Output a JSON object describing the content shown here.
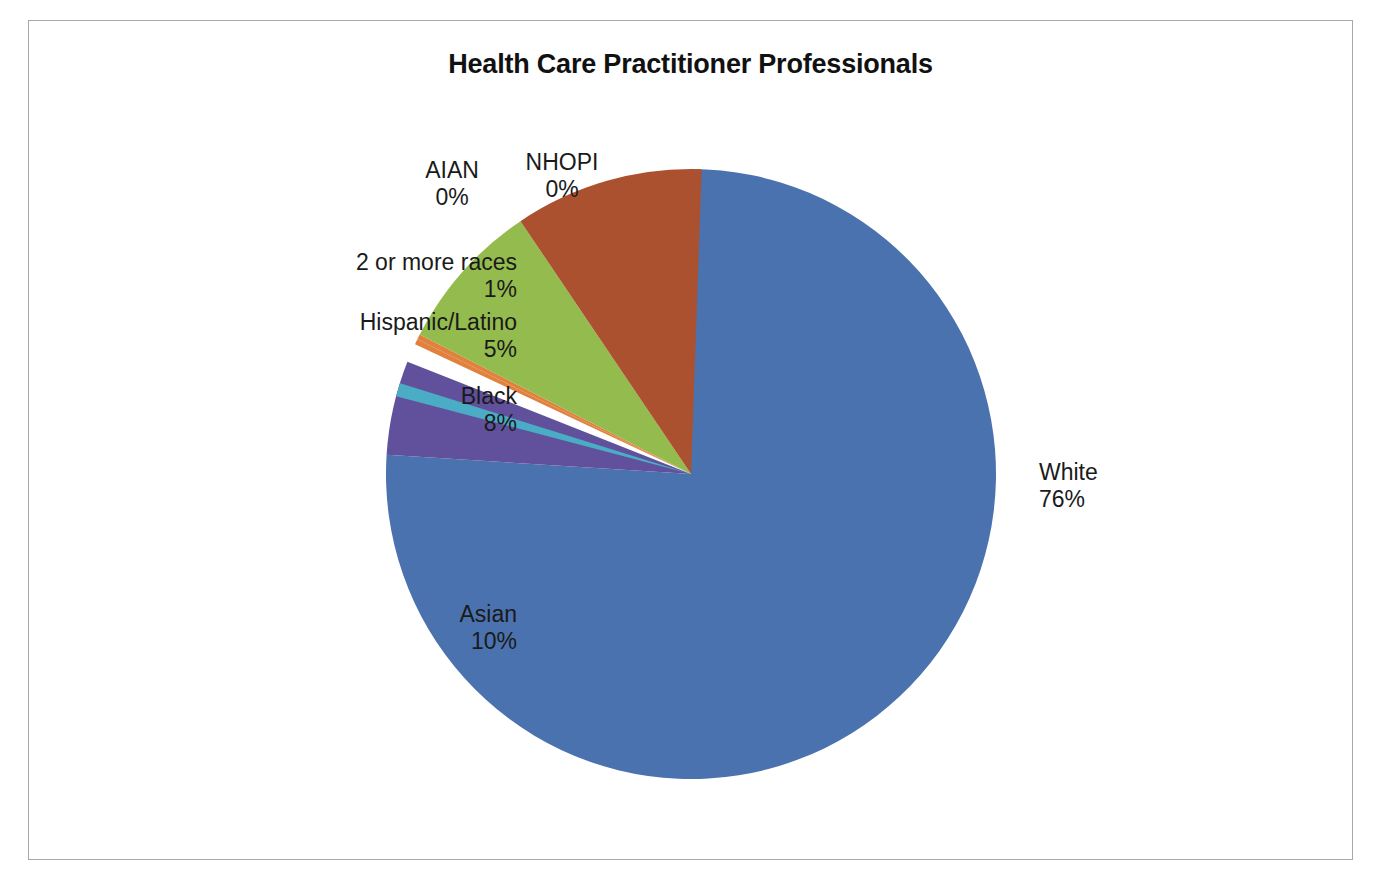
{
  "chart_data": {
    "type": "pie",
    "title": "Health Care Practitioner Professionals",
    "subtitle": "",
    "xlabel": "",
    "ylabel": "",
    "legend_position": "none",
    "labels_shown": "category-and-percent",
    "start_angle_deg": 0,
    "direction": "clockwise",
    "categories": [
      "White",
      "NHOPI",
      "AIAN",
      "2 or more races",
      "Hispanic/Latino",
      "Black",
      "Asian"
    ],
    "values": [
      76,
      0,
      0,
      1,
      5,
      8,
      10
    ],
    "unit": "%",
    "colors": [
      "#4A72AE",
      "#E0813E",
      "#9BBB59",
      "#4BACC6",
      "#61509B",
      "#94BB4E",
      "#AC5130"
    ],
    "slices": [
      {
        "name": "White",
        "value": 76,
        "value_label": "76%",
        "color": "#4A72AE",
        "label_position": "right"
      },
      {
        "name": "NHOPI",
        "value": 0,
        "value_label": "0%",
        "color": "#E0813E",
        "label_position": "top"
      },
      {
        "name": "AIAN",
        "value": 0,
        "value_label": "0%",
        "color": "#E0813E",
        "label_position": "top"
      },
      {
        "name": "2 or more races",
        "value": 1,
        "value_label": "1%",
        "color": "#4BACC6",
        "label_position": "upper-left"
      },
      {
        "name": "Hispanic/Latino",
        "value": 5,
        "value_label": "5%",
        "color": "#61509B",
        "label_position": "left"
      },
      {
        "name": "Black",
        "value": 8,
        "value_label": "8%",
        "color": "#94BB4E",
        "label_position": "left"
      },
      {
        "name": "Asian",
        "value": 10,
        "value_label": "10%",
        "color": "#AC5130",
        "label_position": "lower-left"
      }
    ]
  },
  "frame": {
    "border_color": "#a8a8a8",
    "background": "#ffffff"
  }
}
